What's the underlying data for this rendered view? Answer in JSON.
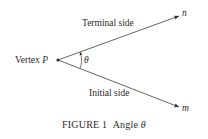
{
  "figure": {
    "labels": {
      "terminal_side": "Terminal side",
      "initial_side": "Initial side",
      "vertex_prefix": "Vertex ",
      "vertex_name": "P",
      "angle": "θ",
      "point_n": "n",
      "point_m": "m"
    },
    "caption": {
      "number": "FIGURE 1",
      "title": "Angle ",
      "symbol": "θ"
    }
  }
}
